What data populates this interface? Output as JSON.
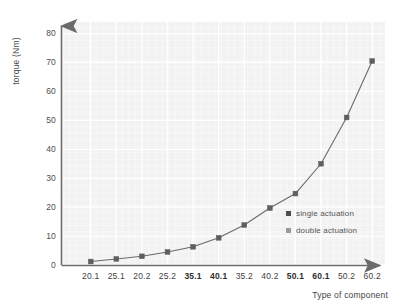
{
  "chart_data": {
    "type": "line",
    "title": "",
    "subtitle": "",
    "xlabel": "Type of component",
    "ylabel": "torque (Nm)",
    "categories": [
      "20.1",
      "25.1",
      "20.2",
      "25.2",
      "35.1",
      "40.1",
      "35.2",
      "40.2",
      "50.1",
      "60.1",
      "50.2",
      "60.2"
    ],
    "values": [
      1.2,
      2.1,
      3.0,
      4.5,
      6.3,
      9.4,
      13.8,
      19.7,
      24.7,
      35.0,
      51.0,
      70.5
    ],
    "series": [
      {
        "name": "single actuation",
        "categories": [
          "20.1",
          "25.1",
          "20.2",
          "25.2",
          "35.1",
          "40.1",
          "35.2",
          "40.2",
          "50.1",
          "60.1",
          "50.2",
          "60.2"
        ],
        "values": [
          1.2,
          2.1,
          3.0,
          4.5,
          6.3,
          9.4,
          13.8,
          19.7,
          24.7,
          35.0,
          51.0,
          70.5
        ],
        "color": "#5a5a5a"
      }
    ],
    "ylim": [
      0,
      84
    ],
    "yticks": [
      0,
      10,
      20,
      30,
      40,
      50,
      60,
      70,
      80
    ],
    "ytick_labels": [
      "0",
      "10",
      "20",
      "30",
      "40",
      "50",
      "60",
      "70",
      "80"
    ],
    "xtick_labels": [
      "20.1",
      "25.1",
      "20.2",
      "25.2",
      "35.1",
      "40.1",
      "35.2",
      "40.2",
      "50.1",
      "60.1",
      "50.2",
      "60.2"
    ],
    "xtick_bold": [
      false,
      false,
      false,
      false,
      true,
      true,
      false,
      false,
      true,
      true,
      false,
      false
    ],
    "grid": true,
    "grid_color": "#ffffff",
    "plot_background": "#f2f2f2",
    "legend_position": "inside-right",
    "legend": [
      {
        "label": "single actuation",
        "color": "#4f4f4f"
      },
      {
        "label": "double actuation",
        "color": "#9a9a9a"
      }
    ],
    "axis_color": "#6b6b6b",
    "marker": "square",
    "marker_color": "#5e5e5e",
    "line_color": "#6a6a6a"
  }
}
